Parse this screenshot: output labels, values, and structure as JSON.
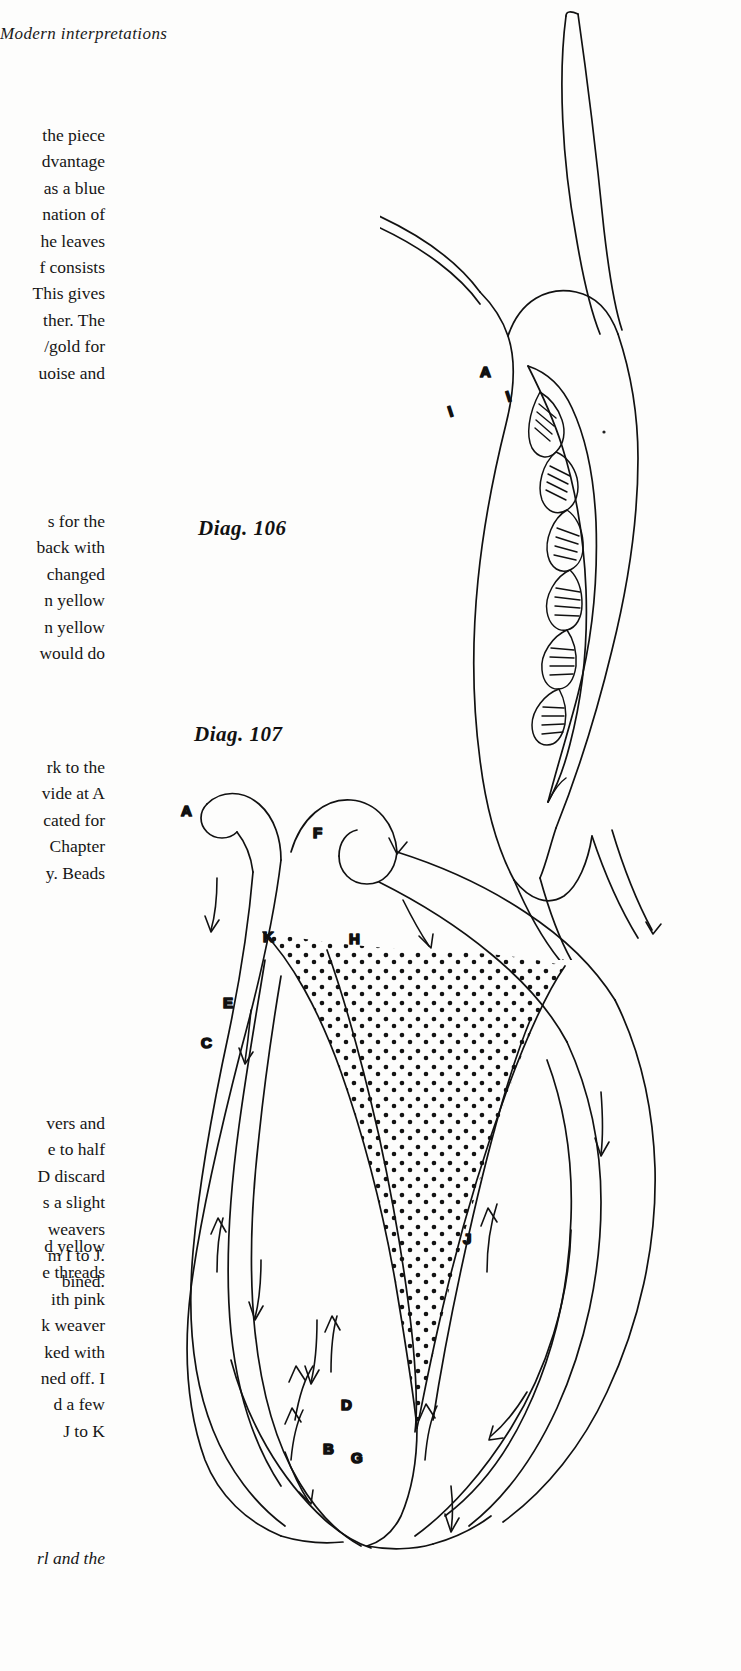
{
  "page": {
    "running_head": "Modern interpretations",
    "background_color": "#fdfdfc",
    "ink_color": "#111111",
    "width": 741,
    "height": 1671
  },
  "columns": {
    "note": "Left text column is cropped by the page edge; only the right-hand fragment of each line is visible."
  },
  "paragraphs": [
    {
      "id": "para1",
      "lines": [
        "the piece",
        "dvantage",
        "as a blue",
        "nation of",
        "he leaves",
        "f consists",
        "This gives",
        "ther. The",
        "/gold for",
        "uoise and"
      ]
    },
    {
      "id": "para2",
      "lines": [
        "s for the",
        "back with",
        "changed",
        "n yellow",
        "n  yellow",
        "would do"
      ]
    },
    {
      "id": "para3",
      "lines": [
        "rk to the",
        "vide at A",
        "cated for",
        "Chapter",
        "y. Beads"
      ]
    },
    {
      "id": "para4",
      "lines": [
        "vers and",
        "e to half",
        "D discard",
        "s a slight",
        "weavers",
        "m I to J.",
        "bined."
      ]
    },
    {
      "id": "para5",
      "lines": [
        "d  yellow",
        "e threads",
        "ith pink",
        "k weaver",
        "ked with",
        "ned off. I",
        "d a few",
        "J to K"
      ]
    },
    {
      "id": "para6",
      "lines": [
        "rl and the"
      ]
    }
  ],
  "captions": {
    "diag106": "Diag. 106",
    "diag107": "Diag. 107"
  },
  "figures": {
    "diag106": {
      "name": "Diag. 106",
      "description": "Line drawing of a beaded pod/leaf shape with two long tapering stems above and two below, opened along the centre to reveal a chevron-woven bead core.",
      "labels": [
        {
          "text": "A",
          "x": 100,
          "y": 377
        },
        {
          "text": "I",
          "x": 70,
          "y": 412
        },
        {
          "text": "I",
          "x": 125,
          "y": 400
        }
      ]
    },
    "diag107": {
      "name": "Diag. 107",
      "description": "Line drawing of a leaf worked in bead weaving, with curled tips at A and F, a stippled central panel, and working-thread arrows marking the direction of travel between lettered points.",
      "labels": [
        {
          "text": "A",
          "x": 93,
          "y": 50
        },
        {
          "text": "F",
          "x": 222,
          "y": 70
        },
        {
          "text": "K",
          "x": 172,
          "y": 178
        },
        {
          "text": "H",
          "x": 257,
          "y": 180
        },
        {
          "text": "E",
          "x": 132,
          "y": 243
        },
        {
          "text": "C",
          "x": 110,
          "y": 282
        },
        {
          "text": "J",
          "x": 372,
          "y": 478
        },
        {
          "text": "D",
          "x": 251,
          "y": 644
        },
        {
          "text": "B",
          "x": 233,
          "y": 688
        },
        {
          "text": "G",
          "x": 261,
          "y": 697
        }
      ],
      "arrow_count": 14,
      "stipple": true
    }
  }
}
